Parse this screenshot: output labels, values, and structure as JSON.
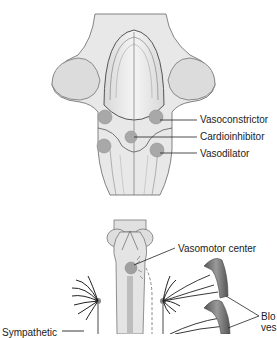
{
  "top_panel": {
    "labels": {
      "vasoconstrictor": "Vasoconstrictor",
      "cardioinhibitor": "Cardioinhibitor",
      "vasodilator": "Vasodilator"
    }
  },
  "bottom_panel": {
    "labels": {
      "vasomotor_center": "Vasomotor center",
      "blood_vessels_line1": "Blo",
      "blood_vessels_line2": "ves",
      "sympathetic": "Sympathetic"
    }
  },
  "colors": {
    "tissue_fill": "#e6e6e6",
    "tissue_stroke": "#555555",
    "nucleus_fill": "#a8a8a8",
    "vessel_fill": "#7a7a7a",
    "line": "#222222"
  }
}
